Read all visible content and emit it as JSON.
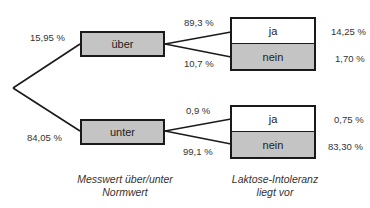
{
  "diagram": {
    "type": "probability-tree",
    "level1": {
      "caption": "Messwert über/unter Normwert",
      "caption_line1": "Messwert über/unter",
      "caption_line2": "Normwert",
      "nodes": [
        {
          "label": "über",
          "probability": "15,95 %"
        },
        {
          "label": "unter",
          "probability": "84,05 %"
        }
      ]
    },
    "level2": {
      "caption": "Laktose-Intoleranz liegt vor",
      "caption_line1": "Laktose-Intoleranz",
      "caption_line2": "liegt vor",
      "groups": [
        {
          "parent": "über",
          "branches": [
            {
              "label": "ja",
              "conditional": "89,3 %",
              "joint": "14,25 %"
            },
            {
              "label": "nein",
              "conditional": "10,7 %",
              "joint": "1,70 %"
            }
          ]
        },
        {
          "parent": "unter",
          "branches": [
            {
              "label": "ja",
              "conditional": "0,9 %",
              "joint": "0,75 %"
            },
            {
              "label": "nein",
              "conditional": "99,1 %",
              "joint": "83,30 %"
            }
          ]
        }
      ]
    },
    "colors": {
      "node_fill": "#c4c4c4",
      "node_border": "#1a1a1a",
      "highlight_fill": "#ffffff"
    }
  }
}
